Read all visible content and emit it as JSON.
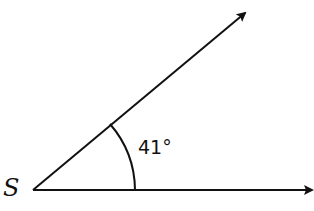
{
  "diagram": {
    "type": "angle",
    "vertex_label": "S",
    "angle_label": "41°",
    "angle_degrees": 41,
    "stroke_color": "#111111"
  }
}
